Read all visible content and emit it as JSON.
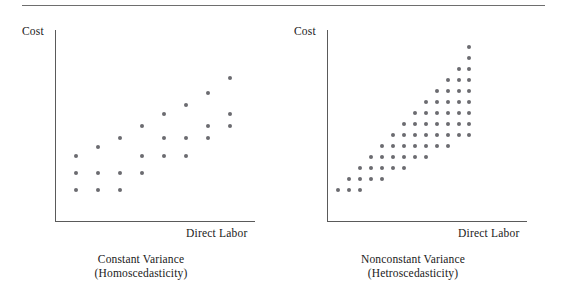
{
  "figure": {
    "has_top_rule": true,
    "dot_color": "#6b6b70",
    "axis_color": "#5a5a5a",
    "rule_color": "#6e6e6e",
    "background": "#ffffff"
  },
  "panels": [
    {
      "id": "homoscedasticity",
      "y_axis_label": "Cost",
      "x_axis_label": "Direct Labor",
      "caption_line1": "Constant Variance",
      "caption_line2": "(Homoscedasticity)"
    },
    {
      "id": "heteroscedasticity",
      "y_axis_label": "Cost",
      "x_axis_label": "Direct Labor",
      "caption_line1": "Nonconstant Variance",
      "caption_line2": "(Hetroscedasticity)"
    }
  ],
  "chart_data": [
    {
      "type": "scatter",
      "title": "Constant Variance (Homoscedasticity)",
      "xlabel": "Direct Labor",
      "ylabel": "Cost",
      "xlim": [
        0,
        200
      ],
      "ylim": [
        0,
        192
      ],
      "grid": false,
      "legend": "none",
      "note": "Points form a band of constant vertical spread rising linearly; 8 columns of 3 points each.",
      "points": [
        [
          21,
          160
        ],
        [
          21,
          143
        ],
        [
          21,
          126
        ],
        [
          43,
          160
        ],
        [
          43,
          143
        ],
        [
          43,
          117
        ],
        [
          65,
          160
        ],
        [
          65,
          143
        ],
        [
          65,
          108
        ],
        [
          87,
          143
        ],
        [
          87,
          126
        ],
        [
          87,
          96
        ],
        [
          109,
          126
        ],
        [
          109,
          108
        ],
        [
          109,
          84
        ],
        [
          131,
          126
        ],
        [
          131,
          108
        ],
        [
          131,
          75
        ],
        [
          153,
          108
        ],
        [
          153,
          96
        ],
        [
          153,
          63
        ],
        [
          175,
          96
        ],
        [
          175,
          84
        ],
        [
          175,
          48
        ]
      ]
    },
    {
      "type": "scatter",
      "title": "Nonconstant Variance (Hetroscedasticity)",
      "xlabel": "Direct Labor",
      "ylabel": "Cost",
      "xlim": [
        0,
        200
      ],
      "ylim": [
        0,
        192
      ],
      "grid": false,
      "legend": "none",
      "note": "Points form a fan/cone that widens with x on a staggered ~11px lattice; the cone is truncated at the right edge near x=142.",
      "lattice": {
        "x_start": 11,
        "x_step": 11.2,
        "y_step": 11.2,
        "columns": 13,
        "stagger": 5.6
      },
      "cone": {
        "apex": [
          11,
          160
        ],
        "upper_slope": -1.22,
        "lower_slope": -0.3,
        "right_cutoff": 142
      },
      "points": [
        [
          11,
          160
        ],
        [
          22,
          149
        ],
        [
          22,
          160
        ],
        [
          33,
          138
        ],
        [
          33,
          149
        ],
        [
          33,
          160
        ],
        [
          44,
          127
        ],
        [
          44,
          138
        ],
        [
          44,
          149
        ],
        [
          55,
          116
        ],
        [
          55,
          127
        ],
        [
          55,
          138
        ],
        [
          55,
          149
        ],
        [
          66,
          105
        ],
        [
          66,
          116
        ],
        [
          66,
          127
        ],
        [
          66,
          138
        ],
        [
          77,
          94
        ],
        [
          77,
          105
        ],
        [
          77,
          116
        ],
        [
          77,
          127
        ],
        [
          77,
          138
        ],
        [
          88,
          83
        ],
        [
          88,
          94
        ],
        [
          88,
          105
        ],
        [
          88,
          116
        ],
        [
          88,
          127
        ],
        [
          99,
          72
        ],
        [
          99,
          83
        ],
        [
          99,
          94
        ],
        [
          99,
          105
        ],
        [
          99,
          116
        ],
        [
          99,
          127
        ],
        [
          110,
          61
        ],
        [
          110,
          72
        ],
        [
          110,
          83
        ],
        [
          110,
          94
        ],
        [
          110,
          105
        ],
        [
          110,
          116
        ],
        [
          121,
          50
        ],
        [
          121,
          61
        ],
        [
          121,
          72
        ],
        [
          121,
          83
        ],
        [
          121,
          94
        ],
        [
          121,
          105
        ],
        [
          121,
          116
        ],
        [
          132,
          39
        ],
        [
          132,
          50
        ],
        [
          132,
          61
        ],
        [
          132,
          72
        ],
        [
          132,
          83
        ],
        [
          132,
          94
        ],
        [
          132,
          105
        ],
        [
          142,
          17
        ],
        [
          142,
          28
        ],
        [
          142,
          39
        ],
        [
          142,
          50
        ],
        [
          142,
          61
        ],
        [
          142,
          72
        ],
        [
          142,
          83
        ],
        [
          142,
          94
        ],
        [
          142,
          105
        ]
      ]
    }
  ]
}
